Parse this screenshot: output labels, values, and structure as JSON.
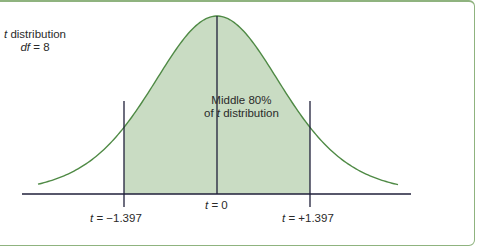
{
  "title": {
    "var": "t",
    "line1_rest": " distribution",
    "line2_var": "df",
    "line2_rest": " = 8"
  },
  "region_label": {
    "line1": "Middle 80%",
    "line2_pre": "of ",
    "line2_var": "t",
    "line2_rest": " distribution"
  },
  "ticks": [
    {
      "var": "t",
      "text": " = −1.397",
      "value": -1.397
    },
    {
      "var": "t",
      "text": " = 0",
      "value": 0
    },
    {
      "var": "t",
      "text": " = +1.397",
      "value": 1.397
    }
  ],
  "colors": {
    "curve": "#4f8a45",
    "fill": "#c9dcc3",
    "axis": "#1f1f3a",
    "border": "#8fb37f"
  },
  "chart_data": {
    "type": "area",
    "distribution": "Student t",
    "df": 8,
    "shaded_region": {
      "from": -1.397,
      "to": 1.397,
      "label": "Middle 80% of t distribution",
      "proportion": 0.8
    },
    "critical_values": [
      -1.397,
      0,
      1.397
    ],
    "xlabel": "t",
    "ylabel": ""
  }
}
